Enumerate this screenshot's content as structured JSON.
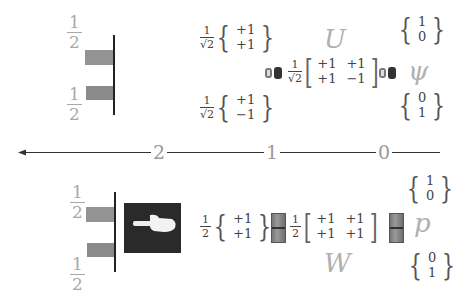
{
  "top_panel": {
    "probability_labels": [
      {
        "num": "1",
        "den": "2"
      },
      {
        "num": "1",
        "den": "2"
      }
    ],
    "state_plus": {
      "coef_num": "1",
      "coef_den": "√2",
      "values": [
        "+1",
        "+1"
      ]
    },
    "state_minus": {
      "coef_num": "1",
      "coef_den": "√2",
      "values": [
        "+1",
        "−1"
      ]
    },
    "operator_label": "U",
    "operator_matrix": {
      "coef_num": "1",
      "coef_den": "√2",
      "rows": [
        [
          "+1",
          "+1"
        ],
        [
          "+1",
          "−1"
        ]
      ]
    },
    "state_label": "ψ",
    "basis_up": [
      "1",
      "0"
    ],
    "basis_down": [
      "0",
      "1"
    ],
    "icons": [
      "speaker-icon",
      "speaker-icon"
    ]
  },
  "axis": {
    "ticks": [
      "2",
      "1",
      "0"
    ],
    "direction": "left-arrow"
  },
  "bottom_panel": {
    "probability_labels": [
      {
        "num": "1",
        "den": "2"
      },
      {
        "num": "1",
        "den": "2"
      }
    ],
    "pointer_icon": "pointing-hand-icon",
    "state_vector": {
      "coef_num": "1",
      "coef_den": "2",
      "values": [
        "+1",
        "+1"
      ]
    },
    "operator_label": "W",
    "operator_matrix": {
      "coef_num": "1",
      "coef_den": "2",
      "rows": [
        [
          "+1",
          "+1"
        ],
        [
          "+1",
          "+1"
        ]
      ]
    },
    "state_label": "p",
    "basis_up": [
      "1",
      "0"
    ],
    "basis_down": [
      "0",
      "1"
    ],
    "icons": [
      "switch-icon",
      "switch-icon"
    ]
  },
  "colors": {
    "bar": "#8a8a8a",
    "label_gray": "#a8a8a8",
    "axis": "#333333",
    "pointer_bg": "#2a2a2a"
  }
}
